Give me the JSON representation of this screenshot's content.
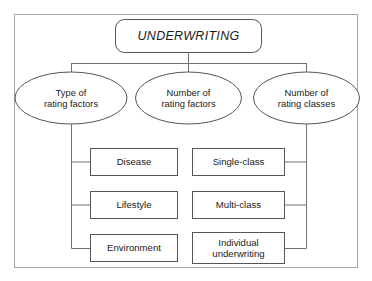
{
  "diagram": {
    "type": "hierarchy-tree",
    "frame": {
      "name": "outer-frame",
      "stroke": "#9a9a9a"
    },
    "colors": {
      "stroke": "#555555",
      "frame_stroke": "#a0a0a0",
      "text": "#1a1a1a",
      "background": "#ffffff"
    },
    "root": {
      "label": "UNDERWRITING",
      "shape": "rounded-rectangle",
      "style": "italic"
    },
    "branches": [
      {
        "label": "Type of\nrating factors",
        "shape": "ellipse",
        "children": [
          {
            "label": "Disease",
            "shape": "rectangle"
          },
          {
            "label": "Lifestyle",
            "shape": "rectangle"
          },
          {
            "label": "Environment",
            "shape": "rectangle"
          }
        ]
      },
      {
        "label": "Number of\nrating factors",
        "shape": "ellipse",
        "children": []
      },
      {
        "label": "Number of\nrating classes",
        "shape": "ellipse",
        "children": [
          {
            "label": "Single-class",
            "shape": "rectangle"
          },
          {
            "label": "Multi-class",
            "shape": "rectangle"
          },
          {
            "label": "Individual\nunderwriting",
            "shape": "rectangle"
          }
        ]
      }
    ]
  }
}
